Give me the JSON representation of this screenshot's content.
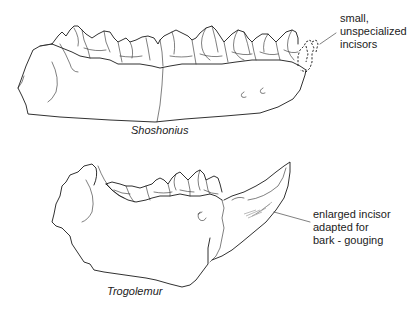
{
  "figure": {
    "type": "comparative anatomical line drawing (lower jaws, lateral view)",
    "background": "#ffffff",
    "line_color": "#1a1a1a"
  },
  "specimens": [
    {
      "name": "Shoshonius",
      "position": "top",
      "annotation": {
        "lines": [
          "small,",
          "unspecialized",
          "incisors"
        ],
        "points_to": "dashed outline of small incisors at anterior (right) end of jaw"
      }
    },
    {
      "name": "Trogolemur",
      "position": "bottom",
      "annotation": {
        "lines": [
          "enlarged incisor",
          "adapted for",
          "bark - gouging"
        ],
        "points_to": "large curved procumbent incisor at anterior (right) end of jaw"
      }
    }
  ]
}
